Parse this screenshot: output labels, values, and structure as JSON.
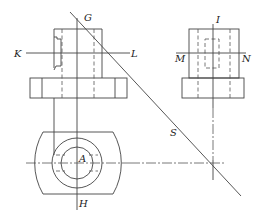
{
  "diagram": {
    "type": "orthographic-projection-drawing",
    "labels": {
      "G": "G",
      "K": "K",
      "L": "L",
      "I": "I",
      "M": "M",
      "N": "N",
      "S": "S",
      "A": "A",
      "H": "H"
    },
    "views": [
      {
        "name": "front-view",
        "position": "top-left"
      },
      {
        "name": "side-view",
        "position": "top-right"
      },
      {
        "name": "top-view",
        "position": "bottom-left"
      }
    ],
    "construction_line": {
      "name": "S",
      "description": "45-degree miter line"
    },
    "colors": {
      "line": "#444444",
      "background": "#ffffff"
    }
  }
}
